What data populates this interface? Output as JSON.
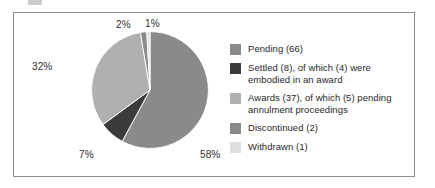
{
  "chart_data": {
    "type": "pie",
    "title": "",
    "subtitle": "",
    "xlabel": "",
    "ylabel": "",
    "legend_position": "right",
    "grid": false,
    "categories": [
      "Pending (66)",
      "Settled (8), of which (4) were embodied in an award",
      "Awards (37), of which (5) pending annulment proceedings",
      "Discontinued (2)",
      "Withdrawn (1)"
    ],
    "values": [
      66,
      8,
      37,
      2,
      1
    ],
    "percent_labels": [
      "58%",
      "7%",
      "32%",
      "2%",
      "1%"
    ],
    "percents": [
      58,
      7,
      32,
      2,
      1
    ],
    "colors": [
      "#8a8a8a",
      "#3b3b3b",
      "#b0b0b0",
      "#8a8a8a",
      "#dedede"
    ],
    "slices": [
      {
        "name": "Pending",
        "label": "Pending (66)",
        "count": 66,
        "percent": 58,
        "percent_label": "58%",
        "color": "#8a8a8a"
      },
      {
        "name": "Settled",
        "label": "Settled (8), of which (4) were embodied in an award",
        "count": 8,
        "percent": 7,
        "percent_label": "7%",
        "color": "#3b3b3b"
      },
      {
        "name": "Awards",
        "label": "Awards (37), of which (5) pending annulment proceedings",
        "count": 37,
        "percent": 32,
        "percent_label": "32%",
        "color": "#b0b0b0"
      },
      {
        "name": "Discontinued",
        "label": "Discontinued (2)",
        "count": 2,
        "percent": 2,
        "percent_label": "2%",
        "color": "#8a8a8a"
      },
      {
        "name": "Withdrawn",
        "label": "Withdrawn (1)",
        "count": 1,
        "percent": 1,
        "percent_label": "1%",
        "color": "#dedede"
      }
    ]
  },
  "legend": {
    "items": [
      {
        "label": "Pending (66)",
        "color": "#8a8a8a"
      },
      {
        "label": "Settled (8), of which (4) were embodied in an award",
        "color": "#3b3b3b"
      },
      {
        "label": "Awards (37), of which (5) pending annulment proceedings",
        "color": "#b0b0b0"
      },
      {
        "label": "Discontinued (2)",
        "color": "#8a8a8a"
      },
      {
        "label": "Withdrawn (1)",
        "color": "#dedede"
      }
    ]
  },
  "percent_labels": {
    "pending": "58%",
    "settled": "7%",
    "awards": "32%",
    "discontinued": "2%",
    "withdrawn": "1%"
  },
  "style": {
    "frame_border": "#8d8d8d",
    "background": "#ffffff",
    "text": "#1f1f1f",
    "slice_separator": "#ffffff"
  }
}
